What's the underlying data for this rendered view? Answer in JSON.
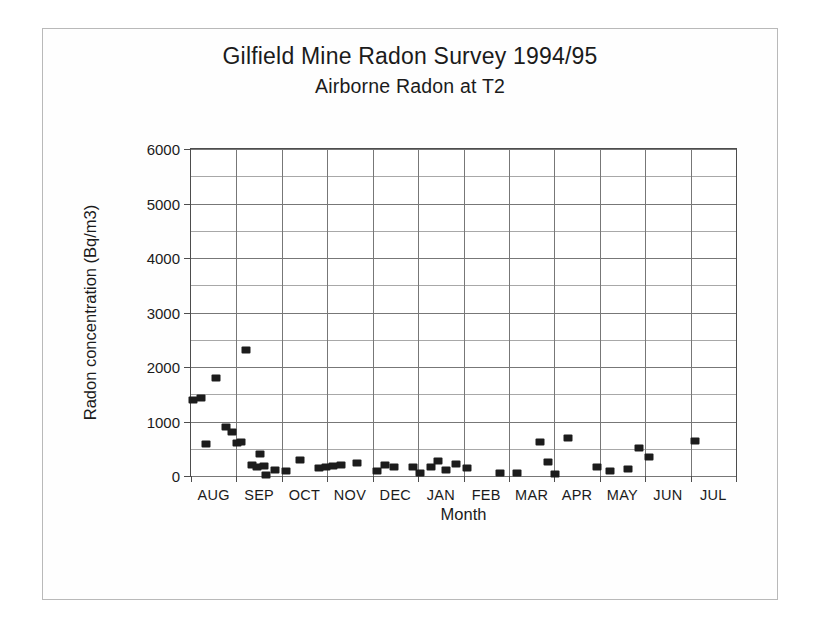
{
  "figure": {
    "title": "Gilfield Mine Radon Survey 1994/95",
    "subtitle": "Airborne Radon at T2"
  },
  "chart_data": {
    "type": "scatter",
    "title": "Gilfield Mine Radon Survey 1994/95",
    "subtitle": "Airborne Radon at T2",
    "xlabel": "Month",
    "ylabel": "Radon concentration  (Bq/m3)",
    "ylim": [
      0,
      6000
    ],
    "yticks": [
      0,
      1000,
      2000,
      3000,
      4000,
      5000,
      6000
    ],
    "ytick_labels": [
      "0",
      "1000",
      "2000",
      "3000",
      "4000",
      "5000",
      "6000"
    ],
    "y_minor_step": 500,
    "grid": "major horizontal and monthly vertical",
    "legend": "none",
    "categories": [
      "AUG",
      "SEP",
      "OCT",
      "NOV",
      "DEC",
      "JAN",
      "FEB",
      "MAR",
      "APR",
      "MAY",
      "JUN",
      "JUL"
    ],
    "xlim_months": [
      0,
      12
    ],
    "marker": "filled square",
    "marker_color": "#1c1c1c",
    "series": [
      {
        "name": "Airborne Radon at T2",
        "points": [
          {
            "month": "AUG",
            "x": 0.05,
            "y": 1400
          },
          {
            "month": "AUG",
            "x": 0.22,
            "y": 1430
          },
          {
            "month": "AUG",
            "x": 0.34,
            "y": 590
          },
          {
            "month": "AUG",
            "x": 0.56,
            "y": 1800
          },
          {
            "month": "AUG",
            "x": 0.78,
            "y": 900
          },
          {
            "month": "AUG",
            "x": 0.9,
            "y": 800
          },
          {
            "month": "SEP",
            "x": 1.02,
            "y": 610
          },
          {
            "month": "SEP",
            "x": 1.1,
            "y": 620
          },
          {
            "month": "SEP",
            "x": 1.22,
            "y": 2320
          },
          {
            "month": "SEP",
            "x": 1.34,
            "y": 200
          },
          {
            "month": "SEP",
            "x": 1.46,
            "y": 170
          },
          {
            "month": "SEP",
            "x": 1.52,
            "y": 400
          },
          {
            "month": "SEP",
            "x": 1.6,
            "y": 180
          },
          {
            "month": "SEP",
            "x": 1.66,
            "y": 20
          },
          {
            "month": "SEP",
            "x": 1.86,
            "y": 110
          },
          {
            "month": "OCT",
            "x": 2.1,
            "y": 100
          },
          {
            "month": "OCT",
            "x": 2.4,
            "y": 290
          },
          {
            "month": "OCT",
            "x": 2.82,
            "y": 150
          },
          {
            "month": "NOV",
            "x": 2.98,
            "y": 170
          },
          {
            "month": "NOV",
            "x": 3.12,
            "y": 185
          },
          {
            "month": "NOV",
            "x": 3.3,
            "y": 195
          },
          {
            "month": "NOV",
            "x": 3.66,
            "y": 240
          },
          {
            "month": "DEC",
            "x": 4.1,
            "y": 95
          },
          {
            "month": "DEC",
            "x": 4.28,
            "y": 210
          },
          {
            "month": "DEC",
            "x": 4.48,
            "y": 160
          },
          {
            "month": "JAN",
            "x": 4.88,
            "y": 165
          },
          {
            "month": "JAN",
            "x": 5.04,
            "y": 50
          },
          {
            "month": "JAN",
            "x": 5.28,
            "y": 170
          },
          {
            "month": "JAN",
            "x": 5.44,
            "y": 280
          },
          {
            "month": "JAN",
            "x": 5.62,
            "y": 110
          },
          {
            "month": "FEB",
            "x": 5.84,
            "y": 215
          },
          {
            "month": "FEB",
            "x": 6.08,
            "y": 150
          },
          {
            "month": "MAR",
            "x": 6.8,
            "y": 60
          },
          {
            "month": "MAR",
            "x": 7.18,
            "y": 60
          },
          {
            "month": "APR",
            "x": 7.68,
            "y": 620
          },
          {
            "month": "APR",
            "x": 7.86,
            "y": 250
          },
          {
            "month": "APR",
            "x": 8.02,
            "y": 45
          },
          {
            "month": "APR",
            "x": 8.3,
            "y": 700
          },
          {
            "month": "MAY",
            "x": 8.94,
            "y": 160
          },
          {
            "month": "MAY",
            "x": 9.22,
            "y": 100
          },
          {
            "month": "JUN",
            "x": 9.62,
            "y": 120
          },
          {
            "month": "JUN",
            "x": 9.86,
            "y": 510
          },
          {
            "month": "JUN",
            "x": 10.08,
            "y": 350
          },
          {
            "month": "JUL",
            "x": 11.1,
            "y": 640
          }
        ]
      }
    ]
  }
}
